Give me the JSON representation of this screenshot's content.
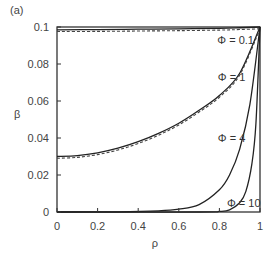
{
  "chart_data": {
    "type": "line",
    "panel_label": "(a)",
    "title": "",
    "xlabel": "ρ",
    "ylabel": "β",
    "xlim": [
      0,
      1
    ],
    "ylim": [
      0,
      0.1
    ],
    "xticks": [
      0,
      0.2,
      0.4,
      0.6,
      0.8,
      1
    ],
    "xtick_labels": [
      "0",
      "0.2",
      "0.4",
      "0.6",
      "0.8",
      "1"
    ],
    "yticks": [
      0,
      0.02,
      0.04,
      0.06,
      0.08,
      0.1
    ],
    "ytick_labels": [
      "0",
      "0.02",
      "0.04",
      "0.06",
      "0.08",
      "0.1"
    ],
    "grid": false,
    "legend": "none (inline annotations)",
    "annotations": [
      {
        "text": "Φ = 0.1",
        "x": 0.88,
        "y": 0.093
      },
      {
        "text": "Φ = 1",
        "x": 0.86,
        "y": 0.073
      },
      {
        "text": "Φ = 4",
        "x": 0.86,
        "y": 0.04
      },
      {
        "text": "Φ = 10",
        "x": 0.92,
        "y": 0.005
      }
    ],
    "series": [
      {
        "name": "Φ = 0.1",
        "style": "solid+dashed",
        "x": [
          0,
          0.2,
          0.4,
          0.6,
          0.8,
          0.9,
          1
        ],
        "y": [
          0.0985,
          0.0986,
          0.0988,
          0.099,
          0.0993,
          0.0996,
          0.1
        ]
      },
      {
        "name": "Φ = 1",
        "style": "solid+dashed",
        "x": [
          0,
          0.1,
          0.2,
          0.3,
          0.4,
          0.5,
          0.6,
          0.7,
          0.8,
          0.9,
          1
        ],
        "y": [
          0.03,
          0.0305,
          0.032,
          0.0345,
          0.038,
          0.0425,
          0.048,
          0.055,
          0.063,
          0.075,
          0.1
        ]
      },
      {
        "name": "Φ = 4",
        "x": [
          0,
          0.3,
          0.5,
          0.6,
          0.7,
          0.8,
          0.85,
          0.9,
          0.95,
          1
        ],
        "y": [
          0,
          0.0001,
          0.0006,
          0.0015,
          0.004,
          0.012,
          0.02,
          0.034,
          0.058,
          0.1
        ]
      },
      {
        "name": "Φ = 10",
        "x": [
          0,
          0.7,
          0.8,
          0.85,
          0.9,
          0.93,
          0.96,
          0.98,
          1
        ],
        "y": [
          0,
          0,
          0.0003,
          0.0012,
          0.005,
          0.011,
          0.026,
          0.048,
          0.1
        ]
      }
    ]
  }
}
